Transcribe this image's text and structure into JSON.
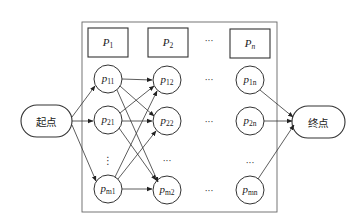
{
  "diagram": {
    "type": "flow-network",
    "start_node": {
      "label": "起点"
    },
    "end_node": {
      "label": "终点"
    },
    "stage_boxes": [
      {
        "id": "P1",
        "symbol": "P",
        "sub": "1"
      },
      {
        "id": "P2",
        "symbol": "P",
        "sub": "2"
      },
      {
        "id": "Pn",
        "symbol": "P",
        "sub": "n"
      }
    ],
    "nodes": [
      {
        "id": "p11",
        "symbol": "p",
        "sub": "11"
      },
      {
        "id": "p12",
        "symbol": "p",
        "sub": "12"
      },
      {
        "id": "p1n",
        "symbol": "p",
        "sub": "1n"
      },
      {
        "id": "p21",
        "symbol": "p",
        "sub": "21"
      },
      {
        "id": "p22",
        "symbol": "p",
        "sub": "22"
      },
      {
        "id": "p2n",
        "symbol": "p",
        "sub": "2n"
      },
      {
        "id": "pm1",
        "symbol": "p",
        "sub": "m1"
      },
      {
        "id": "pm2",
        "symbol": "p",
        "sub": "m2"
      },
      {
        "id": "pmn",
        "symbol": "p",
        "sub": "mn"
      }
    ],
    "ellipsis": {
      "horizontal": "···",
      "vertical": "⋮"
    },
    "edges": [
      [
        "起点",
        "p11"
      ],
      [
        "起点",
        "p21"
      ],
      [
        "起点",
        "pm1"
      ],
      [
        "p11",
        "p12"
      ],
      [
        "p11",
        "p22"
      ],
      [
        "p11",
        "pm2"
      ],
      [
        "p21",
        "p12"
      ],
      [
        "p21",
        "p22"
      ],
      [
        "p21",
        "pm2"
      ],
      [
        "pm1",
        "p12"
      ],
      [
        "pm1",
        "p22"
      ],
      [
        "pm1",
        "pm2"
      ],
      [
        "p1n",
        "终点"
      ],
      [
        "p2n",
        "终点"
      ],
      [
        "pmn",
        "终点"
      ]
    ],
    "colors": {
      "line": "#333333",
      "background": "#ffffff"
    }
  }
}
